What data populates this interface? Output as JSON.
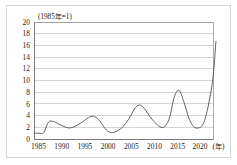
{
  "figure": {
    "unit_note": "(1985年=1)",
    "axis_unit_suffix": "(年)"
  },
  "chart_data": {
    "type": "line",
    "title": "(1985年=1)",
    "subtitle": "",
    "xlabel": "(年)",
    "ylabel": "",
    "xlim": [
      1985,
      2022
    ],
    "ylim": [
      0,
      20
    ],
    "grid": true,
    "legend": false,
    "legend_position": "none",
    "y_ticks": [
      0,
      2,
      4,
      6,
      8,
      10,
      12,
      14,
      16,
      18,
      20
    ],
    "x_ticks": [
      1985,
      1990,
      1995,
      2000,
      2005,
      2010,
      2015,
      2020
    ],
    "x_tick_labels": [
      "1985",
      "1990",
      "1995",
      "2000",
      "2005",
      "2010",
      "2015",
      "2020"
    ],
    "y_tick_labels": [
      "0",
      "2",
      "4",
      "6",
      "8",
      "10",
      "12",
      "14",
      "16",
      "18",
      "20"
    ],
    "series": [
      {
        "name": "index",
        "x": [
          1985,
          1986,
          1987,
          1988,
          1989,
          1990,
          1991,
          1992,
          1993,
          1994,
          1995,
          1996,
          1997,
          1998,
          1999,
          2000,
          2001,
          2002,
          2003,
          2004,
          2005,
          2006,
          2007,
          2008,
          2009,
          2010,
          2011,
          2012,
          2013,
          2014,
          2015,
          2016,
          2017,
          2018,
          2019,
          2020,
          2021,
          2022
        ],
        "values": [
          1.0,
          1.0,
          1.1,
          2.9,
          3.0,
          2.6,
          2.2,
          1.9,
          2.0,
          2.4,
          2.9,
          3.5,
          3.9,
          3.6,
          2.6,
          1.5,
          1.1,
          1.3,
          1.8,
          2.7,
          4.0,
          5.4,
          5.8,
          5.0,
          3.8,
          2.8,
          2.1,
          2.1,
          3.6,
          7.2,
          8.3,
          6.3,
          3.6,
          2.1,
          1.9,
          2.6,
          5.6,
          10.5
        ]
      }
    ],
    "end_point": {
      "x": 2022.6,
      "y": 16.7
    }
  }
}
